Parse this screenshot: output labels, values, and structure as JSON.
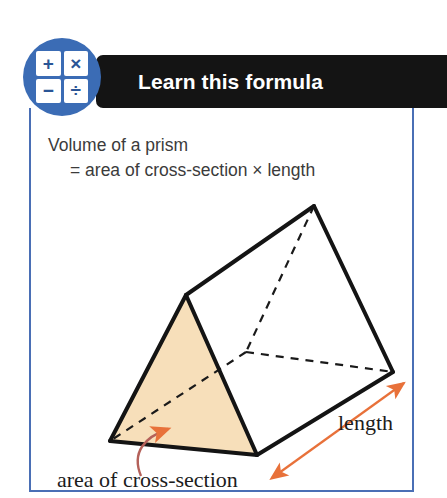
{
  "header": {
    "title": "Learn this formula",
    "bar_color": "#141414",
    "badge": {
      "name": "calculator-badge",
      "circle_color": "#3b6cb5",
      "symbol_color": "#2a5596",
      "symbols": [
        "+",
        "×",
        "−",
        "÷"
      ]
    }
  },
  "frame": {
    "border_color": "#4a6fb5",
    "background": "#ffffff"
  },
  "formula": {
    "line1": "Volume of a prism",
    "line2": "= area of cross-section × length",
    "text_color": "#3b3b3b"
  },
  "diagram": {
    "type": "triangular-prism",
    "solid_edge_color": "#141414",
    "hidden_edge_color": "#1a1a1a",
    "cross_section_fill": "#f7dfba",
    "annotation_color": "#e8713a",
    "curved_arrow_color": "#b4615a",
    "labels": {
      "length": "length",
      "cross_section": "area of cross-section"
    },
    "vertices": {
      "front_apex": [
        186,
        295
      ],
      "front_bottom_left": [
        110,
        441
      ],
      "front_bottom_right": [
        257,
        455
      ],
      "back_apex": [
        314,
        206
      ],
      "back_bottom_right": [
        393,
        372
      ],
      "hidden_vertex": [
        246,
        352
      ]
    }
  }
}
